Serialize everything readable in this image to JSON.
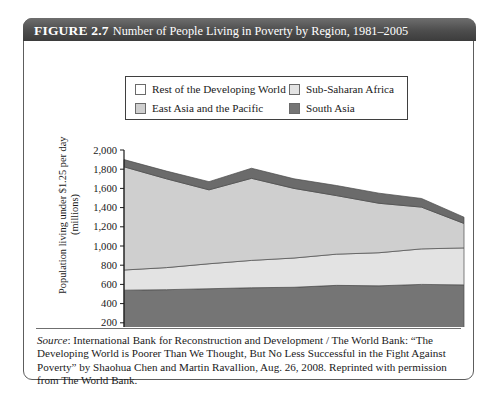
{
  "figure": {
    "number_label": "FIGURE 2.7",
    "title": "Number of People Living in Poverty by Region, 1981–2005"
  },
  "legend": {
    "items": [
      {
        "label": "Rest of the Developing World",
        "color": "#6b6b6b",
        "row": 0,
        "col": 0
      },
      {
        "label": "Sub-Saharan Africa",
        "color": "#e3e3e3",
        "row": 0,
        "col": 1
      },
      {
        "label": "East Asia and the Pacific",
        "color": "#cfcfcf",
        "row": 1,
        "col": 0
      },
      {
        "label": "South Asia",
        "color": "#757575",
        "row": 1,
        "col": 1
      }
    ]
  },
  "axes": {
    "ylabel_line1": "Population living under $1.25 per day",
    "ylabel_line2": "(millions)",
    "ylabel": "Population living under $1.25 per day\n(millions)"
  },
  "source": {
    "source_word": "Source",
    "text": ": International Bank for Reconstruction and Development / The World Bank: “The Developing World is Poorer Than We Thought, But No Less Successful in the Fight Against Poverty” by Shaohua Chen and Martin Ravallion, Aug. 26, 2008.  Reprinted with permission from The World Bank."
  },
  "chart_data": {
    "type": "area",
    "stacked": true,
    "title": "Number of People Living in Poverty by Region, 1981–2005",
    "xlabel": "",
    "ylabel": "Population living under $1.25 per day (millions)",
    "x": [
      1981,
      1984,
      1987,
      1990,
      1993,
      1996,
      1999,
      2002,
      2005
    ],
    "xtick_labels": [
      "1981",
      "1984",
      "1987",
      "1990",
      "1993",
      "1996",
      "1999",
      "2002",
      "2005"
    ],
    "ylim": [
      0,
      2000
    ],
    "ytick_values": [
      0,
      200,
      400,
      600,
      800,
      1000,
      1200,
      1400,
      1600,
      1800,
      2000
    ],
    "ytick_labels": [
      "0",
      "200",
      "400",
      "600",
      "800",
      "1,000",
      "1,200",
      "1,400",
      "1,600",
      "1,800",
      "2,000"
    ],
    "grid": false,
    "legend_position": "top-center",
    "stack_order_bottom_to_top": [
      "South Asia",
      "Sub-Saharan Africa",
      "East Asia and the Pacific",
      "Rest of the Developing World"
    ],
    "series": [
      {
        "name": "South Asia",
        "color": "#757575",
        "values": [
          540,
          545,
          555,
          565,
          570,
          590,
          585,
          600,
          595
        ]
      },
      {
        "name": "Sub-Saharan Africa",
        "color": "#e3e3e3",
        "values": [
          210,
          230,
          260,
          285,
          305,
          325,
          345,
          370,
          385
        ]
      },
      {
        "name": "East Asia and the Pacific",
        "color": "#cfcfcf",
        "values": [
          1075,
          925,
          770,
          855,
          725,
          610,
          515,
          435,
          255
        ]
      },
      {
        "name": "Rest of the Developing World",
        "color": "#6b6b6b",
        "values": [
          75,
          80,
          85,
          105,
          100,
          105,
          105,
          90,
          65
        ]
      }
    ],
    "totals": [
      1900,
      1780,
      1670,
      1810,
      1700,
      1630,
      1550,
      1495,
      1300
    ]
  }
}
